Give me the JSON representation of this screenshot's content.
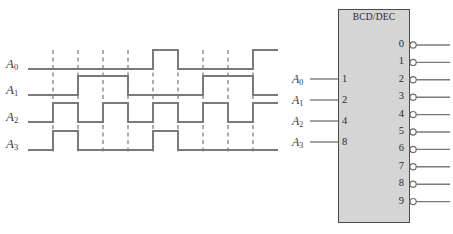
{
  "figure": {
    "type": "logic-timing-and-symbol"
  },
  "timing": {
    "signals": [
      {
        "name": "A0",
        "label": "A",
        "subscript": "0"
      },
      {
        "name": "A1",
        "label": "A",
        "subscript": "1"
      },
      {
        "name": "A2",
        "label": "A",
        "subscript": "2"
      },
      {
        "name": "A3",
        "label": "A",
        "subscript": "3"
      }
    ],
    "gridlines": 9,
    "waveforms": {
      "A0": [
        0,
        0,
        0,
        0,
        0,
        1,
        0,
        0,
        0,
        1,
        0
      ],
      "A1": [
        0,
        0,
        1,
        1,
        0,
        0,
        0,
        1,
        1,
        0,
        0
      ],
      "A2": [
        0,
        1,
        0,
        1,
        0,
        1,
        0,
        1,
        0,
        1,
        0
      ],
      "A3": [
        0,
        1,
        0,
        0,
        0,
        1,
        0,
        0,
        0,
        0,
        0
      ]
    }
  },
  "chip": {
    "title": "BCD/DEC",
    "inputs": [
      {
        "label": "A",
        "subscript": "0",
        "weight": "1"
      },
      {
        "label": "A",
        "subscript": "1",
        "weight": "2"
      },
      {
        "label": "A",
        "subscript": "2",
        "weight": "4"
      },
      {
        "label": "A",
        "subscript": "3",
        "weight": "8"
      }
    ],
    "outputs": [
      "0",
      "1",
      "2",
      "3",
      "4",
      "5",
      "6",
      "7",
      "8",
      "9"
    ],
    "output_inverted": true
  },
  "colors": {
    "line": "#7a7a7a",
    "chip_fill": "#d5d5d5",
    "chip_border": "#4a4a4a",
    "text": "#3c3c3c",
    "background": "#ffffff"
  }
}
